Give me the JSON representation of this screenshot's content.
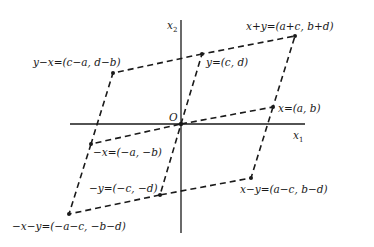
{
  "diagram": {
    "axes": {
      "x1_label": "x",
      "x1_sub": "1",
      "x2_label": "x",
      "x2_sub": "2",
      "origin_label": "O"
    },
    "points": [
      {
        "id": "x_plus_y",
        "label": "x+y=(a+c, b+d)"
      },
      {
        "id": "y",
        "label": "y=(c, d)"
      },
      {
        "id": "x",
        "label": "x=(a, b)"
      },
      {
        "id": "y_minus_x",
        "label": "y−x=(c−a, d−b)"
      },
      {
        "id": "neg_x",
        "label": "−x=(−a, −b)"
      },
      {
        "id": "neg_y",
        "label": "−y=(−c, −d)"
      },
      {
        "id": "x_minus_y",
        "label": "x−y=(a−c, b−d)"
      },
      {
        "id": "neg_x_neg_y",
        "label": "−x−y=(−a−c, −b−d)"
      }
    ],
    "colors": {
      "ink": "#1a1a1a",
      "background": "#ffffff"
    }
  }
}
